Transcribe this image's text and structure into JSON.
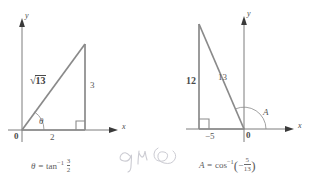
{
  "figure": {
    "stroke_color": "#7a7a7a",
    "axis_color": "#6e6e6e",
    "text_color": "#5b5b5b",
    "background": "#ffffff"
  },
  "left_diagram": {
    "name": "theta-triangle",
    "axis_labels": {
      "x": "x",
      "y": "y"
    },
    "origin_label": "0",
    "angle_label": "θ",
    "hypotenuse_label_radical": "√",
    "hypotenuse_label_value": "13",
    "opposite_label": "3",
    "adjacent_label": "2",
    "formula": {
      "lhs": "θ",
      "equals": "=",
      "fn": "tan",
      "exponent": "−1",
      "numerator": "3",
      "denominator": "2",
      "full_text": "θ = tan⁻¹ 3/2"
    },
    "geometry": {
      "origin": [
        22,
        130
      ],
      "right_vertex": [
        85,
        130
      ],
      "apex": [
        85,
        44
      ],
      "right_angle_marker": true,
      "angle_arc_degrees": 56
    }
  },
  "right_diagram": {
    "name": "angle-A-triangle",
    "axis_labels": {
      "x": "x",
      "y": "y"
    },
    "origin_label": "0",
    "angle_label": "A",
    "vertical_leg_label": "12",
    "hypotenuse_label": "13",
    "x_intercept_label": "−5",
    "formula": {
      "lhs": "A",
      "equals": "=",
      "fn": "cos",
      "exponent": "−1",
      "open_paren": "(",
      "sign": "−",
      "numerator": "5",
      "denominator": "13",
      "close_paren": ")",
      "full_text": "A = cos⁻¹(−5/13)"
    },
    "geometry": {
      "origin": [
        244,
        129
      ],
      "left_vertex": [
        199,
        129
      ],
      "apex": [
        199,
        24
      ],
      "right_angle_marker": true,
      "angle_arc_degrees": 113
    }
  },
  "annotation": {
    "name": "handwritten-note",
    "text": "9 14",
    "description": "faint pencil handwriting with scribble"
  }
}
